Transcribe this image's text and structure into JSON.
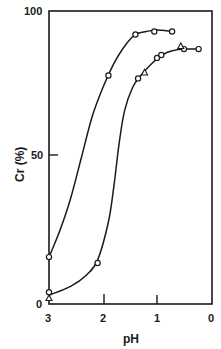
{
  "chart_data": {
    "type": "line",
    "title": "",
    "xlabel": "pH",
    "ylabel": "Cr (%)",
    "xlim": [
      3,
      0
    ],
    "ylim": [
      0,
      100
    ],
    "x_reversed": true,
    "x_ticks": [
      3,
      2,
      1,
      0
    ],
    "y_ticks": [
      0,
      50,
      100
    ],
    "grid": false,
    "legend": "none",
    "series": [
      {
        "name": "curve-left (circles)",
        "marker": "circle",
        "points": [
          [
            3.0,
            16
          ],
          [
            1.9,
            78
          ],
          [
            1.4,
            92
          ],
          [
            1.05,
            93
          ],
          [
            0.72,
            93
          ]
        ],
        "curve": [
          [
            3.0,
            16
          ],
          [
            2.8,
            25
          ],
          [
            2.6,
            36
          ],
          [
            2.4,
            50
          ],
          [
            2.2,
            64
          ],
          [
            2.0,
            74
          ],
          [
            1.8,
            82
          ],
          [
            1.6,
            88
          ],
          [
            1.4,
            92
          ],
          [
            1.2,
            93
          ],
          [
            1.0,
            93.5
          ],
          [
            0.72,
            93
          ]
        ]
      },
      {
        "name": "curve-right (circles and triangles)",
        "marker": "circle",
        "points": [
          [
            3.0,
            4
          ],
          [
            2.1,
            14
          ],
          [
            1.35,
            77
          ],
          [
            1.0,
            84
          ],
          [
            0.92,
            85
          ],
          [
            0.5,
            87
          ],
          [
            0.23,
            87
          ]
        ],
        "triangles": [
          [
            3.0,
            2
          ],
          [
            1.23,
            79
          ],
          [
            0.56,
            88
          ]
        ],
        "curve": [
          [
            3.0,
            3
          ],
          [
            2.6,
            6
          ],
          [
            2.3,
            10
          ],
          [
            2.1,
            15
          ],
          [
            1.9,
            28
          ],
          [
            1.8,
            40
          ],
          [
            1.7,
            55
          ],
          [
            1.6,
            66
          ],
          [
            1.45,
            74
          ],
          [
            1.3,
            78
          ],
          [
            1.1,
            82
          ],
          [
            0.9,
            85
          ],
          [
            0.7,
            86.5
          ],
          [
            0.5,
            87
          ],
          [
            0.23,
            87
          ]
        ]
      }
    ]
  },
  "labels": {
    "y_tick_100": "100",
    "y_tick_50": "50",
    "y_tick_0": "0",
    "x_tick_3": "3",
    "x_tick_2": "2",
    "x_tick_1": "1",
    "x_tick_0": "0",
    "xlabel": "pH",
    "ylabel": "Cr (%)"
  }
}
